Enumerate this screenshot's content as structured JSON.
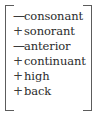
{
  "matrix": {
    "label": "distinctive-feature-matrix",
    "bracket": {
      "left_glyph": "[",
      "right_glyph": "]"
    },
    "colors": {
      "background": "#ffffff",
      "text": "#2b2b2b",
      "bracket": "#5c5c5c",
      "sign": "#3a3a3a"
    },
    "rows": [
      {
        "sign": "—",
        "value": "minus",
        "feature": "consonant"
      },
      {
        "sign": "+",
        "value": "plus",
        "feature": "sonorant"
      },
      {
        "sign": "—",
        "value": "minus",
        "feature": "anterior"
      },
      {
        "sign": "+",
        "value": "plus",
        "feature": "continuant"
      },
      {
        "sign": "+",
        "value": "plus",
        "feature": "high"
      },
      {
        "sign": "+",
        "value": "plus",
        "feature": "back"
      }
    ]
  }
}
